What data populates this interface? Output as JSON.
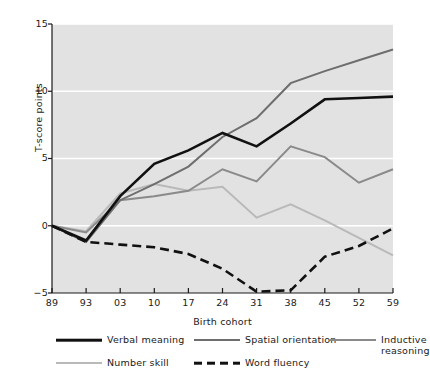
{
  "chart_data": {
    "type": "line",
    "title": "",
    "xlabel": "Birth cohort",
    "ylabel": "T-score points",
    "categories": [
      "89",
      "93",
      "03",
      "10",
      "17",
      "24",
      "31",
      "38",
      "45",
      "52",
      "59"
    ],
    "xlim": [
      0,
      10
    ],
    "ylim": [
      -5,
      15
    ],
    "yticks": [
      15,
      10,
      5,
      0,
      -5
    ],
    "grid": "horizontal-white",
    "legend_position": "below",
    "plot_background": "#e2e2e2",
    "gridline_color": "#ffffff",
    "series": [
      {
        "name": "Verbal meaning",
        "color": "#111111",
        "width": 2.6,
        "dash": "none",
        "values": [
          0,
          -1.1,
          2.2,
          4.6,
          5.6,
          6.9,
          5.9,
          7.6,
          9.4,
          9.5,
          9.6
        ]
      },
      {
        "name": "Spatial orientation",
        "color": "#6e6e6e",
        "width": 2.0,
        "dash": "none",
        "values": [
          0,
          -1.2,
          1.9,
          3.1,
          4.4,
          6.6,
          8.0,
          10.6,
          11.5,
          12.3,
          13.1
        ]
      },
      {
        "name": "Inductive reasoning",
        "color": "#8a8a8a",
        "width": 2.0,
        "dash": "none",
        "values": [
          0,
          -0.5,
          1.9,
          2.2,
          2.6,
          4.2,
          3.3,
          5.9,
          5.1,
          3.2,
          4.2
        ]
      },
      {
        "name": "Number skill",
        "color": "#b9b9b9",
        "width": 2.0,
        "dash": "none",
        "values": [
          0,
          -0.4,
          2.4,
          3.1,
          2.6,
          2.9,
          0.6,
          1.6,
          0.4,
          -0.9,
          -2.2
        ]
      },
      {
        "name": "Word fluency",
        "color": "#111111",
        "width": 2.6,
        "dash": "dashed",
        "values": [
          0,
          -1.2,
          -1.4,
          -1.6,
          -2.1,
          -3.2,
          -4.9,
          -4.8,
          -2.3,
          -1.5,
          -0.2
        ]
      }
    ]
  },
  "axis": {
    "ylabel": "T-score points",
    "xlabel": "Birth cohort",
    "yticks": [
      "15",
      "10",
      "5",
      "0",
      "−5"
    ],
    "xticks": [
      "89",
      "93",
      "03",
      "10",
      "17",
      "24",
      "31",
      "38",
      "45",
      "52",
      "59"
    ]
  },
  "legend": {
    "items": [
      {
        "label": "Verbal meaning",
        "color": "#111111",
        "dash": "none",
        "width": 2.6
      },
      {
        "label": "Spatial orientation",
        "color": "#6e6e6e",
        "dash": "none",
        "width": 2.0
      },
      {
        "label": "Inductive\nreasoning",
        "color": "#8a8a8a",
        "dash": "none",
        "width": 2.0
      },
      {
        "label": "Number skill",
        "color": "#b9b9b9",
        "dash": "none",
        "width": 2.0
      },
      {
        "label": "Word fluency",
        "color": "#111111",
        "dash": "dashed",
        "width": 2.6
      }
    ]
  }
}
